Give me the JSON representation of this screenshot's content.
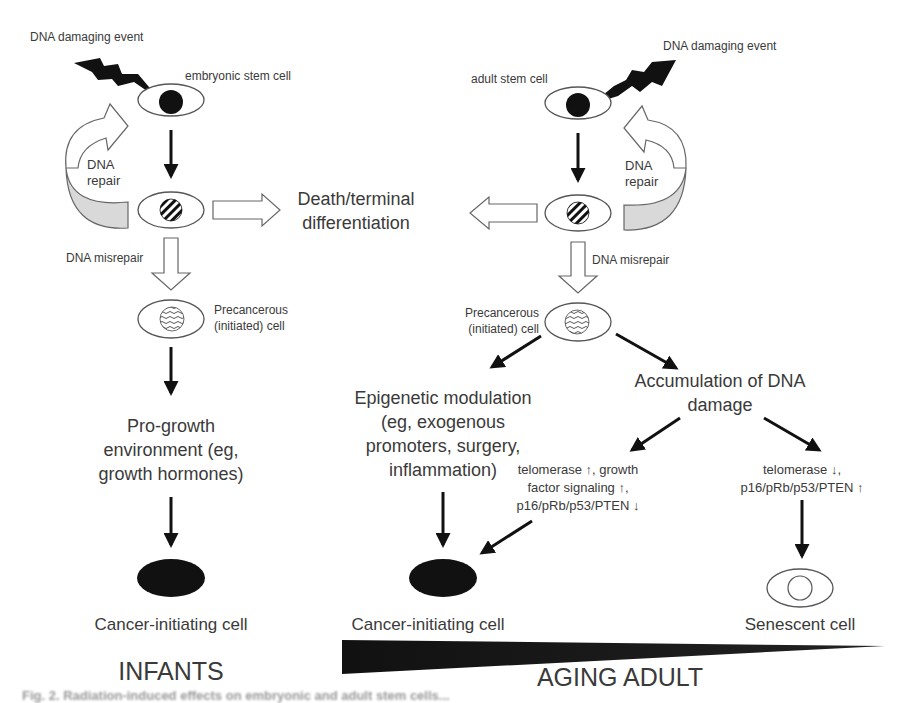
{
  "figure": {
    "left_panel": {
      "damaging_event": "DNA damaging event",
      "stem_cell": "embryonic stem cell",
      "repair": [
        "DNA",
        "repair"
      ],
      "misrepair": "DNA misrepair",
      "precancerous": [
        "Precancerous",
        "(initiated) cell"
      ],
      "environment": [
        "Pro-growth",
        "environment (eg,",
        "growth hormones)"
      ],
      "outcome": "Cancer-initiating cell",
      "age_group": "INFANTS"
    },
    "center": {
      "death": [
        "Death/terminal",
        "differentiation"
      ]
    },
    "right_panel": {
      "damaging_event": "DNA damaging event",
      "stem_cell": "adult stem cell",
      "repair": [
        "DNA",
        "repair"
      ],
      "misrepair": "DNA misrepair",
      "precancerous": [
        "Precancerous",
        "(initiated) cell"
      ],
      "epigenetic": [
        "Epigenetic modulation",
        "(eg, exogenous",
        "promoters, surgery,",
        "inflammation)"
      ],
      "accumulation": [
        "Accumulation of DNA",
        "damage"
      ],
      "branch_cancer": [
        "telomerase ↑, growth",
        "factor signaling ↑,",
        "p16/pRb/p53/PTEN ↓"
      ],
      "branch_senescence": [
        "telomerase ↓,",
        "p16/pRb/p53/PTEN ↑"
      ],
      "outcome_cancer": "Cancer-initiating cell",
      "outcome_senescent": "Senescent cell",
      "age_group": "AGING ADULT"
    },
    "caption_fragment": "Fig. 2. Radiation-induced effects on embryonic and adult stem cells..."
  },
  "colors": {
    "ink": "#111111",
    "text": "#3a3a3a",
    "outline": "#555555",
    "shade": "#d9d9d9"
  }
}
